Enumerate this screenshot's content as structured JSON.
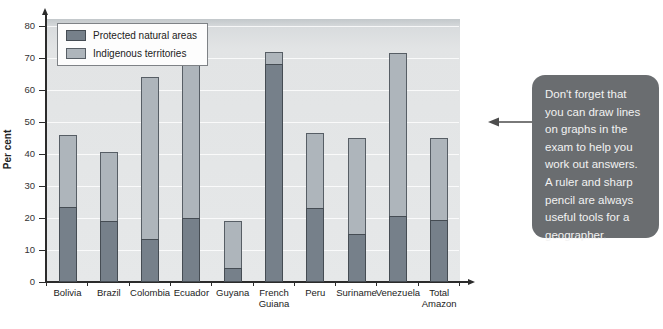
{
  "chart_data": {
    "type": "bar",
    "stacked": true,
    "title": "",
    "xlabel": "",
    "ylabel": "Per cent",
    "ylim": [
      0,
      80
    ],
    "yticks": [
      0,
      10,
      20,
      30,
      40,
      50,
      60,
      70,
      80
    ],
    "grid": true,
    "legend_position": "top-left",
    "categories": [
      "Bolivia",
      "Brazil",
      "Colombia",
      "Ecuador",
      "Guyana",
      "French Guiana",
      "Peru",
      "Suriname",
      "Venezuela",
      "Total Amazon"
    ],
    "series": [
      {
        "name": "Protected natural areas",
        "color": "#76808a",
        "border": "#454c53",
        "values": [
          23.5,
          19,
          13.5,
          20,
          4.5,
          68,
          23,
          15,
          20.5,
          19.5
        ]
      },
      {
        "name": "Indigenous territories",
        "color": "#aeb5bb",
        "border": "#575e65",
        "values": [
          22.5,
          21.5,
          50.5,
          52,
          14.5,
          4,
          23.5,
          30,
          51,
          25.5
        ]
      }
    ],
    "stack_totals": [
      46,
      40.5,
      64,
      72,
      19,
      72,
      46.5,
      45,
      71.5,
      45
    ]
  },
  "callout": {
    "lines": [
      "Don't forget that",
      "you can draw lines",
      "on graphs in the",
      "exam to help you",
      "work out answers.",
      "A ruler and sharp",
      "pencil are always",
      "useful tools for a",
      "geographer."
    ],
    "bg_color": "#6a6d70",
    "text_color": "#f2f2f2"
  },
  "colors": {
    "axis": "#2b2b2b",
    "plot_bg": "#e3e5e6",
    "gridline": "#f2f3f4",
    "arrow": "#4d4d4d"
  }
}
